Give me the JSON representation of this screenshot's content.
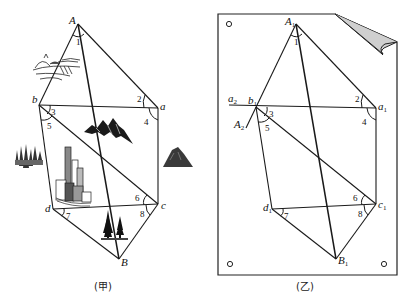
{
  "left_figure": {
    "caption": "(甲)",
    "points": {
      "A": "A",
      "a": "a",
      "b": "b",
      "c": "c",
      "d": "d",
      "B": "B"
    },
    "angles": [
      "1",
      "2",
      "3",
      "4",
      "5",
      "6",
      "7",
      "8"
    ],
    "icons": [
      "river-bridge-sketch",
      "mountain-range",
      "forest",
      "city-buildings",
      "lone-mountain",
      "pine-trees"
    ]
  },
  "right_figure": {
    "caption": "(乙)",
    "points": {
      "A1": "A",
      "a1": "a",
      "b1": "b",
      "c1": "c",
      "d1": "d",
      "B1": "B",
      "a2": "a",
      "A2": "A"
    },
    "subscripts": {
      "one": "1",
      "two": "2"
    },
    "angles": [
      "1",
      "2",
      "3",
      "4",
      "5",
      "6",
      "7",
      "8"
    ],
    "paper": "plane-table-sheet-with-folded-corner"
  }
}
